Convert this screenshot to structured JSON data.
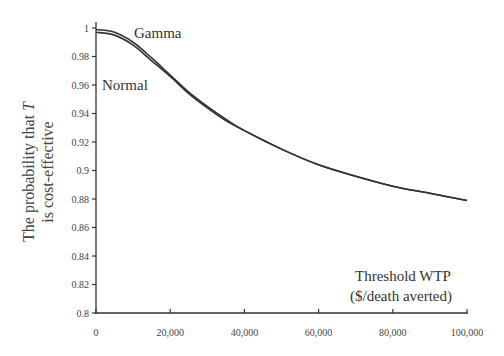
{
  "chart_data": {
    "type": "line",
    "title": "",
    "xlabel": "Threshold WTP ($/death averted)",
    "xlabel_lines": [
      "Threshold WTP",
      "($/death averted)"
    ],
    "ylabel": "The probability that T is cost-effective",
    "ylabel_lines": [
      "The probability that T",
      "is cost-effective"
    ],
    "xlim": [
      0,
      100000
    ],
    "ylim": [
      0.8,
      1.0
    ],
    "grid": false,
    "legend": "inline annotations",
    "x_ticks": [
      0,
      20000,
      40000,
      60000,
      80000,
      100000
    ],
    "x_tick_labels": [
      "0",
      "20,000",
      "40,000",
      "60,000",
      "80,000",
      "100,000"
    ],
    "y_ticks": [
      0.8,
      0.82,
      0.84,
      0.86,
      0.88,
      0.9,
      0.92,
      0.94,
      0.96,
      0.98,
      1.0
    ],
    "y_tick_labels": [
      "0.8",
      "0.82",
      "0.84",
      "0.86",
      "0.88",
      "0.9",
      "0.92",
      "0.94",
      "0.96",
      "0.98",
      "1"
    ],
    "x": [
      0,
      5000,
      10000,
      15000,
      20000,
      25000,
      30000,
      35000,
      40000,
      50000,
      60000,
      70000,
      80000,
      90000,
      100000
    ],
    "series": [
      {
        "name": "Gamma",
        "values": [
          0.999,
          0.997,
          0.99,
          0.979,
          0.967,
          0.955,
          0.945,
          0.936,
          0.928,
          0.915,
          0.904,
          0.896,
          0.889,
          0.884,
          0.879
        ]
      },
      {
        "name": "Normal",
        "values": [
          0.997,
          0.995,
          0.988,
          0.977,
          0.966,
          0.954,
          0.944,
          0.935,
          0.928,
          0.915,
          0.904,
          0.896,
          0.889,
          0.884,
          0.879
        ]
      }
    ],
    "annotations": [
      {
        "text": "Gamma",
        "near_x": 20000,
        "near_y": 0.995
      },
      {
        "text": "Normal",
        "near_x": 2000,
        "near_y": 0.96
      }
    ]
  },
  "labels": {
    "gamma": "Gamma",
    "normal": "Normal",
    "ylabel_line1": "The probability that ",
    "ylabel_italic": "T",
    "ylabel_line2": "is cost-effective",
    "xlabel_line1": "Threshold WTP",
    "xlabel_line2": "($/death averted)"
  },
  "colors": {
    "axis": "#333333",
    "curve": "#333333",
    "background": "#ffffff"
  }
}
